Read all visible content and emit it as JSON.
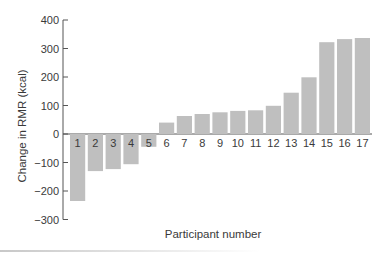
{
  "chart_data": {
    "type": "bar",
    "title": "",
    "xlabel": "Participant number",
    "ylabel": "Change in RMR (kcal)",
    "ylim": [
      -300,
      400
    ],
    "yticks": [
      400,
      300,
      200,
      100,
      0,
      -100,
      -200,
      -300
    ],
    "ytick_labels": [
      "400",
      "300",
      "200",
      "100",
      "0",
      "−100",
      "−200",
      "−300"
    ],
    "grid": false,
    "legend": null,
    "category_labels_position": "just below zero line",
    "categories": [
      "1",
      "2",
      "3",
      "4",
      "5",
      "6",
      "7",
      "8",
      "9",
      "10",
      "11",
      "12",
      "13",
      "14",
      "15",
      "16",
      "17"
    ],
    "values": [
      -235,
      -130,
      -123,
      -106,
      -45,
      40,
      63,
      70,
      76,
      81,
      83,
      99,
      145,
      199,
      322,
      333,
      337
    ],
    "colors": {
      "bar": "#bfbfbf",
      "axis": "#555555",
      "text": "#3a3a3a"
    }
  }
}
